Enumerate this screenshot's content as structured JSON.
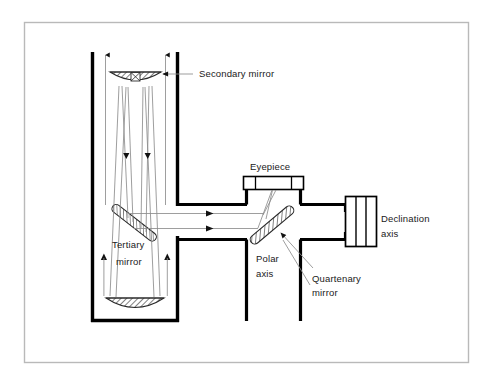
{
  "figure": {
    "kind": "optical-ray-diagram",
    "background_color": "#ffffff",
    "frame_color": "#b9b9b9",
    "ink_color": "#000000",
    "ray_color": "#8c8c8c",
    "leader_color": "#8c8c8c",
    "hatch_color": "#4a4a4a"
  },
  "labels": {
    "secondary_mirror": "Secondary mirror",
    "tertiary_mirror_line1": "Tertiary",
    "tertiary_mirror_line2": "mirror",
    "eyepiece": "Eyepiece",
    "polar_axis_line1": "Polar",
    "polar_axis_line2": "axis",
    "quartenary_mirror_line1": "Quartenary",
    "quartenary_mirror_line2": "mirror",
    "declination_axis_line1": "Declination",
    "declination_axis_line2": "axis"
  },
  "components": [
    {
      "name": "telescope-tube",
      "note": "open vertical tube, thick black walls"
    },
    {
      "name": "primary-mirror",
      "note": "concave hatched mirror at tube bottom"
    },
    {
      "name": "secondary-mirror",
      "note": "small convex hatched mirror near tube top"
    },
    {
      "name": "tertiary-mirror",
      "note": "flat hatched mirror angled in tube"
    },
    {
      "name": "quartenary-mirror",
      "note": "flat hatched mirror in mount, directs to eyepiece"
    },
    {
      "name": "eyepiece",
      "note": "flat rectangular housing with internal divisions"
    },
    {
      "name": "declination-axis",
      "note": "cylinder block at right of mount"
    },
    {
      "name": "polar-axis",
      "note": "vertical tube below mount junction"
    }
  ],
  "ray_paths": [
    {
      "name": "incoming-light",
      "direction": "downward",
      "note": "parallel rays enter tube top, arrows point down"
    },
    {
      "name": "primary-reflection",
      "direction": "upward",
      "note": "rays converge upward from primary to secondary"
    },
    {
      "name": "secondary-reflection",
      "direction": "downward",
      "note": "rays travel down to tertiary mirror"
    },
    {
      "name": "tertiary-reflection",
      "direction": "rightward",
      "note": "horizontal rays to quartenary mirror, arrows point right"
    },
    {
      "name": "quartenary-reflection",
      "direction": "upward",
      "note": "rays converge up into eyepiece"
    }
  ]
}
